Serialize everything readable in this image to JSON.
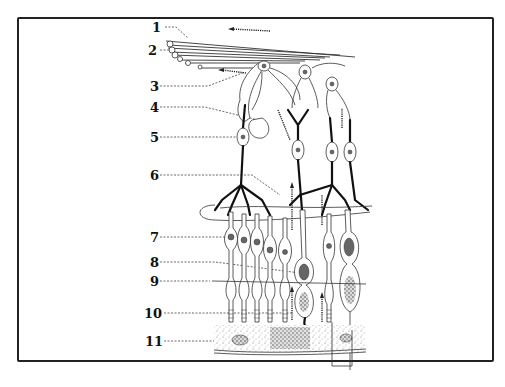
{
  "diagram": {
    "type": "anatomical-illustration",
    "labels": [
      {
        "number": "1",
        "y": 27
      },
      {
        "number": "2",
        "y": 50
      },
      {
        "number": "3",
        "y": 86
      },
      {
        "number": "4",
        "y": 107
      },
      {
        "number": "5",
        "y": 137
      },
      {
        "number": "6",
        "y": 175
      },
      {
        "number": "7",
        "y": 237
      },
      {
        "number": "8",
        "y": 262
      },
      {
        "number": "9",
        "y": 281
      },
      {
        "number": "10",
        "y": 313
      },
      {
        "number": "11",
        "y": 341
      }
    ],
    "colors": {
      "ink": "#111111",
      "background": "#ffffff",
      "frame": "#222222"
    }
  }
}
